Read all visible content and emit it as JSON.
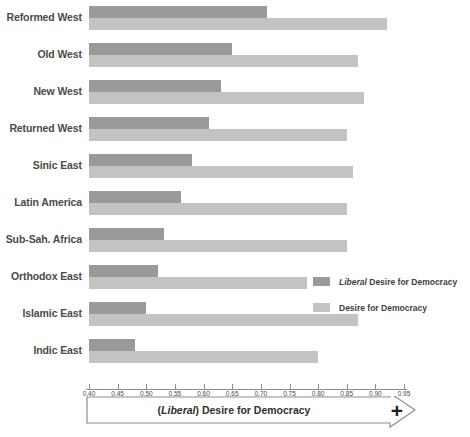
{
  "chart_data": {
    "type": "bar",
    "orientation": "horizontal",
    "title": "(Liberal) Desire for Democracy",
    "xlabel": "(Liberal) Desire for Democracy",
    "ylabel": "",
    "xlim": [
      0.4,
      0.95
    ],
    "xticks": [
      "0.40",
      "0.45",
      "0.50",
      "0.55",
      "0.60",
      "0.65",
      "0.70",
      "0.75",
      "0.80",
      "0.85",
      "0.90",
      "0.95"
    ],
    "xtick_values": [
      0.4,
      0.45,
      0.5,
      0.55,
      0.6,
      0.65,
      0.7,
      0.75,
      0.8,
      0.85,
      0.9,
      0.95
    ],
    "grid": false,
    "legend_position": "center-right",
    "categories": [
      "Reformed West",
      "Old West",
      "New West",
      "Returned West",
      "Sinic East",
      "Latin America",
      "Sub-Sah. Africa",
      "Orthodox East",
      "Islamic East",
      "Indic East"
    ],
    "series": [
      {
        "name": "Liberal Desire for Democracy",
        "color": "#9a9a9a",
        "values": [
          0.71,
          0.65,
          0.63,
          0.61,
          0.58,
          0.56,
          0.53,
          0.52,
          0.5,
          0.48
        ]
      },
      {
        "name": "Desire for Democracy",
        "color": "#c3c3c3",
        "values": [
          0.92,
          0.87,
          0.88,
          0.85,
          0.86,
          0.85,
          0.85,
          0.78,
          0.87,
          0.8
        ]
      }
    ]
  },
  "legend": {
    "items": [
      {
        "emphasis": "Liberal",
        "label": " Desire for Democracy"
      },
      {
        "emphasis": "",
        "label": "Desire for Democracy"
      }
    ]
  },
  "axis_banner": {
    "emphasis": "Liberal",
    "prefix": "(",
    "suffix": ") Desire for Democracy",
    "plus": "+"
  }
}
